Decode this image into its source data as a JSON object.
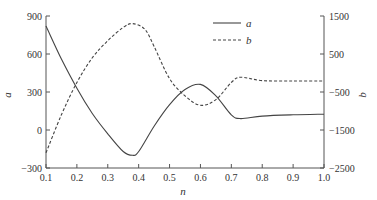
{
  "chart_data": {
    "type": "line",
    "title": "",
    "xlabel": "n",
    "ylabel_left": "a",
    "ylabel_right": "b",
    "xlim": [
      0.1,
      1.0
    ],
    "ylim_left": [
      -300,
      900
    ],
    "ylim_right": [
      -2500,
      1500
    ],
    "x_ticks": [
      "0.1",
      "0.2",
      "0.3",
      "0.4",
      "0.5",
      "0.6",
      "0.7",
      "0.8",
      "0.9",
      "1.0"
    ],
    "y_ticks_left": [
      "-300",
      "0",
      "300",
      "600",
      "900"
    ],
    "y_ticks_right": [
      "-2500",
      "-1500",
      "-500",
      "500",
      "1500"
    ],
    "grid": false,
    "legend": {
      "position": "upper center-right",
      "entries": [
        {
          "label": "a",
          "style": "solid"
        },
        {
          "label": "b",
          "style": "dashed"
        }
      ]
    },
    "series": [
      {
        "name": "a",
        "axis": "left",
        "style": "solid",
        "x": [
          0.1,
          0.15,
          0.2,
          0.25,
          0.3,
          0.35,
          0.38,
          0.4,
          0.45,
          0.5,
          0.55,
          0.6,
          0.65,
          0.7,
          0.73,
          0.8,
          0.9,
          1.0
        ],
        "values": [
          820,
          560,
          330,
          130,
          -30,
          -170,
          -200,
          -170,
          30,
          200,
          320,
          360,
          270,
          120,
          90,
          110,
          120,
          125
        ]
      },
      {
        "name": "b",
        "axis": "right",
        "style": "dashed",
        "x": [
          0.1,
          0.15,
          0.2,
          0.25,
          0.3,
          0.35,
          0.38,
          0.42,
          0.45,
          0.5,
          0.55,
          0.6,
          0.65,
          0.7,
          0.73,
          0.8,
          0.9,
          1.0
        ],
        "values": [
          -2100,
          -1100,
          -250,
          400,
          850,
          1200,
          1300,
          1150,
          700,
          -150,
          -600,
          -850,
          -700,
          -250,
          -110,
          -200,
          -210,
          -210
        ]
      }
    ]
  },
  "labels": {
    "xlabel": "n",
    "ylabel_left": "a",
    "ylabel_right": "b",
    "legend_a": "a",
    "legend_b": "b"
  }
}
